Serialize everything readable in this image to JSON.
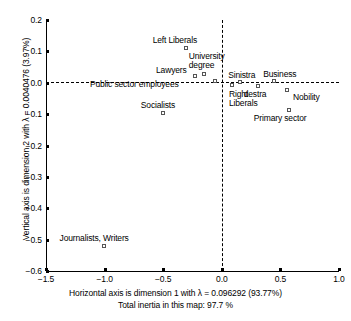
{
  "chart_data": {
    "type": "scatter",
    "title": "",
    "xlabel": "Horizontal axis is dimension 1 with λ = 0.096292 (93.77%)",
    "xlabel_line2": "Total inertia in this map: 97.7 %",
    "ylabel": "Vertical axis is dimension 2 with λ = 0.0040476 (3.97%)",
    "xlim": [
      -1.5,
      1.0
    ],
    "ylim": [
      -0.6,
      0.2
    ],
    "xticks": [
      "-1.5",
      "-1.0",
      "-0.5",
      "0.0",
      "0.5",
      "1.0"
    ],
    "xtick_values": [
      -1.5,
      -1.0,
      -0.5,
      0.0,
      0.5,
      1.0
    ],
    "yticks": [
      "0.2",
      "0.1",
      "0.0",
      "-0.1",
      "-0.2",
      "-0.3",
      "-0.4",
      "-0.5",
      "-0.6"
    ],
    "ytick_values": [
      0.2,
      0.1,
      0.0,
      -0.1,
      -0.2,
      -0.3,
      -0.4,
      -0.5,
      -0.6
    ],
    "grid": false,
    "legend": "none",
    "reference_lines": {
      "horizontal": 0.0,
      "vertical": 0.0,
      "style": "dashed"
    },
    "dimension_1_lambda": 0.096292,
    "dimension_1_percent": 93.77,
    "dimension_2_lambda": 0.0040476,
    "dimension_2_percent": 3.97,
    "total_inertia_percent": 97.7,
    "points": [
      {
        "label": "Left Liberals",
        "x": -0.3,
        "y": 0.108,
        "label_dx": -34,
        "label_dy": -13
      },
      {
        "label": "University\ndegree",
        "x": -0.145,
        "y": 0.025,
        "label_dx": -16,
        "label_dy": -23
      },
      {
        "label": "Lawyers",
        "x": -0.22,
        "y": 0.018,
        "label_dx": -40,
        "label_dy": -11
      },
      {
        "label": "Public sector employees",
        "x": -0.05,
        "y": 0.003,
        "label_dx": -126,
        "label_dy": -2
      },
      {
        "label": "Sinistra",
        "x": 0.165,
        "y": 0.0,
        "label_dx": -13,
        "label_dy": -12
      },
      {
        "label": "Business",
        "x": 0.455,
        "y": 0.002,
        "label_dx": -12,
        "label_dy": -12
      },
      {
        "label": "Right\nLiberals",
        "x": 0.095,
        "y": -0.01,
        "label_dx": -4,
        "label_dy": 4
      },
      {
        "label": "destra",
        "x": 0.315,
        "y": -0.015,
        "label_dx": -15,
        "label_dy": 3
      },
      {
        "label": "Nobility",
        "x": 0.565,
        "y": -0.025,
        "label_dx": 5,
        "label_dy": 2
      },
      {
        "label": "Socialists",
        "x": -0.495,
        "y": -0.1,
        "label_dx": -23,
        "label_dy": -13
      },
      {
        "label": "Primary sector",
        "x": 0.58,
        "y": -0.09,
        "label_dx": -36,
        "label_dy": 3
      },
      {
        "label": "Journalists, Writers",
        "x": -1.0,
        "y": -0.525,
        "label_dx": -45,
        "label_dy": -13
      }
    ]
  },
  "colors": {
    "background": "#ffffff",
    "axis": "#000000",
    "marker_stroke": "#555555",
    "text": "#000000"
  }
}
